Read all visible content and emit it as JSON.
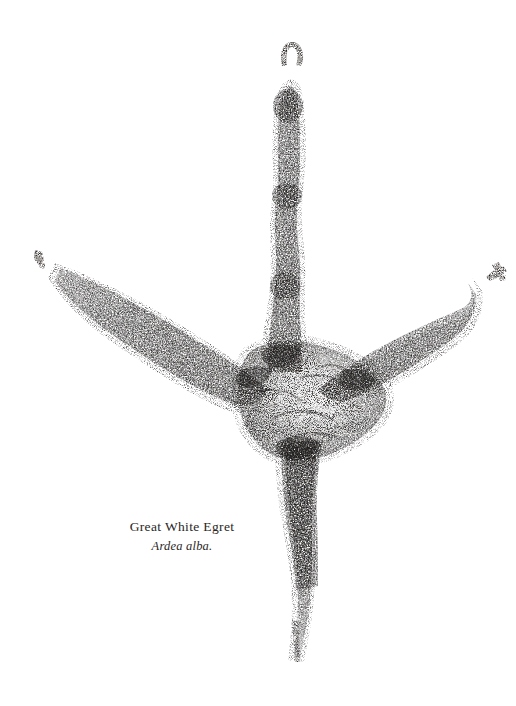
{
  "plate": {
    "background_color": "#ffffff",
    "ink_color": "#1c1a19",
    "subject": "bird-footprint-track",
    "technique": "stipple-ink-impression"
  },
  "caption": {
    "common_name": "Great White Egret",
    "scientific_name": "Ardea alba.",
    "text_color": "#2a2725"
  },
  "track_data": {
    "type": "stipple-impression",
    "description": "Four-toed wading bird track: one long anterior toe, two lateral toes splayed outward, one posterior hallux trailing below, joined at a mottled central metatarsal pad.",
    "parts": [
      {
        "name": "anterior-toe",
        "label": "Toe III (front)",
        "orientation": "vertical-up",
        "tip": [
          292,
          86
        ],
        "base": [
          288,
          350
        ],
        "claw_mark": [
          292,
          52
        ]
      },
      {
        "name": "left-lateral-toe",
        "label": "Toe II (left)",
        "orientation": "diagonal-upper-left",
        "tip": [
          57,
          272
        ],
        "base": [
          258,
          375
        ],
        "claw_mark": [
          38,
          256
        ]
      },
      {
        "name": "right-lateral-toe",
        "label": "Toe IV (right)",
        "orientation": "diagonal-upper-right",
        "tip": [
          474,
          291
        ],
        "base": [
          348,
          383
        ],
        "claw_mark": [
          496,
          272
        ]
      },
      {
        "name": "hallux-toe",
        "label": "Toe I (hind)",
        "orientation": "vertical-down",
        "tip": [
          296,
          660
        ],
        "base": [
          305,
          440
        ],
        "claw_mark": null
      },
      {
        "name": "metatarsal-pad",
        "label": "Central pad",
        "center": [
          308,
          400
        ],
        "width": 150,
        "height": 120
      }
    ],
    "bounds": {
      "x": 33,
      "y": 40,
      "width": 475,
      "height": 625
    },
    "stipple_density": "high-edge-low-center"
  }
}
